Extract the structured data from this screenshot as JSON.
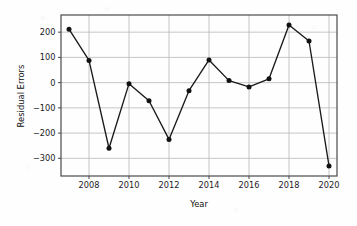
{
  "chart_data": {
    "type": "line",
    "title": "",
    "xlabel": "Year",
    "ylabel": "Residual Errors",
    "x": [
      2007,
      2008,
      2009,
      2010,
      2011,
      2012,
      2013,
      2014,
      2015,
      2016,
      2017,
      2018,
      2019,
      2020
    ],
    "values": [
      212,
      88,
      -260,
      -4,
      -72,
      -225,
      -32,
      90,
      8,
      -17,
      15,
      228,
      165,
      -330
    ],
    "series": [
      {
        "name": "Residual Errors",
        "values": [
          212,
          88,
          -260,
          -4,
          -72,
          -225,
          -32,
          90,
          8,
          -17,
          15,
          228,
          165,
          -330
        ]
      }
    ],
    "xlim": [
      2006.6,
      2020.4
    ],
    "ylim": [
      -370,
      268
    ],
    "xticks": [
      2008,
      2010,
      2012,
      2014,
      2016,
      2018,
      2020
    ],
    "xtick_labels": [
      "2008",
      "2010",
      "2012",
      "2014",
      "2016",
      "2018",
      "2020"
    ],
    "yticks": [
      200,
      100,
      0,
      -100,
      -200,
      -300
    ],
    "ytick_labels": [
      "200",
      "100",
      "0",
      "−100",
      "−200",
      "−300"
    ],
    "grid": true,
    "legend": false,
    "marker": "circle",
    "line_color": "#1a1a1a",
    "marker_color": "#111111",
    "grid_color": "#b8b8b8",
    "frame_color": "#4a4a4a",
    "background_color": "#fefefe"
  },
  "axes": {
    "xlabel": "Year",
    "ylabel": "Residual Errors"
  }
}
